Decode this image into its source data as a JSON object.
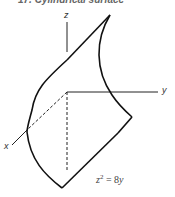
{
  "title": "17. Cylindrical surface",
  "axes": {
    "x": "x",
    "y": "y",
    "z": "z"
  },
  "equation": {
    "lhs_var": "z",
    "exponent": "2",
    "rest": " = 8",
    "rhs_var": "y"
  },
  "colors": {
    "line": "#1a1a1a",
    "text": "#444444"
  }
}
